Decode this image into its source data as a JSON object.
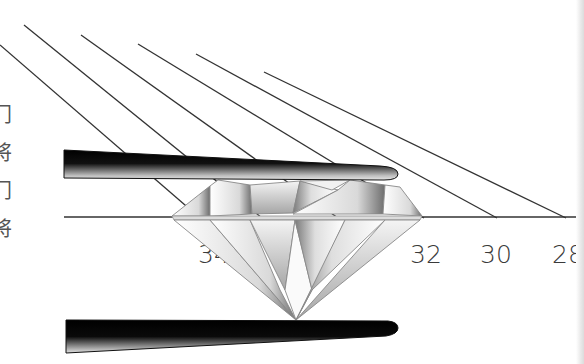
{
  "diagram": {
    "side_text_glyphs": [
      "门",
      "将",
      "门",
      "将"
    ],
    "angle_labels": [
      {
        "text": "34",
        "x": 198,
        "y": 263
      },
      {
        "text": "32",
        "x": 410,
        "y": 263
      },
      {
        "text": "30",
        "x": 480,
        "y": 263
      },
      {
        "text": "28",
        "x": 552,
        "y": 263
      }
    ],
    "colors": {
      "line": "#333333",
      "tweezer_dark": "#000000",
      "tweezer_light": "#c8c8c8",
      "background": "#ffffff"
    }
  }
}
